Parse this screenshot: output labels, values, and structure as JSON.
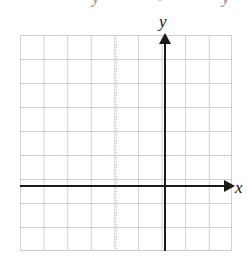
{
  "figure": {
    "type": "coordinate-plane",
    "background_color": "#ffffff",
    "grid": {
      "line_color": "#d0d0d0",
      "columns": 9,
      "rows": 9,
      "cell_size_px": 24,
      "left_px": 20,
      "top_px": 35,
      "width_px": 212,
      "height_px": 216
    },
    "axes": {
      "color": "#1a1a1a",
      "x": {
        "label": "x",
        "orientation": "horizontal",
        "position_y_px": 186,
        "arrow": "right"
      },
      "y": {
        "label": "y",
        "orientation": "vertical",
        "position_x_px": 165,
        "arrow": "up"
      }
    },
    "tick_labels": [],
    "plotted_data": [],
    "artifacts": {
      "top_left": "y",
      "top_middle": "-",
      "top_right": "y"
    }
  }
}
